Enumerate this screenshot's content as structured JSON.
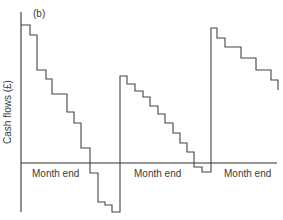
{
  "chart_data": {
    "type": "line",
    "subtype": "step",
    "title": "",
    "panel_label": "(b)",
    "xlabel": "",
    "ylabel": "Cash flows (£)",
    "x_tick_labels": [
      "Month end",
      "Month end",
      "Month end"
    ],
    "grid": false,
    "legend": null,
    "note": "Sawtooth cash-flow pattern: balance falls in steps through each month and jumps up at each month end. Values in relative units (0 = horizontal axis).",
    "series": [
      {
        "name": "Cash balance",
        "points_px": [
          [
            21,
            25
          ],
          [
            30,
            25
          ],
          [
            30,
            35
          ],
          [
            37,
            35
          ],
          [
            37,
            70
          ],
          [
            46,
            70
          ],
          [
            46,
            79
          ],
          [
            52,
            79
          ],
          [
            52,
            94
          ],
          [
            67,
            94
          ],
          [
            67,
            112
          ],
          [
            74,
            112
          ],
          [
            74,
            123
          ],
          [
            81,
            123
          ],
          [
            81,
            148
          ],
          [
            90,
            148
          ],
          [
            90,
            173
          ],
          [
            98,
            173
          ],
          [
            98,
            202
          ],
          [
            105,
            202
          ],
          [
            105,
            205
          ],
          [
            112,
            205
          ],
          [
            112,
            212
          ],
          [
            120,
            212
          ],
          [
            120,
            76
          ],
          [
            127,
            76
          ],
          [
            127,
            84
          ],
          [
            135,
            84
          ],
          [
            135,
            91
          ],
          [
            143,
            91
          ],
          [
            143,
            97
          ],
          [
            150,
            97
          ],
          [
            150,
            106
          ],
          [
            158,
            106
          ],
          [
            158,
            114
          ],
          [
            165,
            114
          ],
          [
            165,
            123
          ],
          [
            173,
            123
          ],
          [
            173,
            133
          ],
          [
            180,
            133
          ],
          [
            180,
            143
          ],
          [
            187,
            143
          ],
          [
            187,
            152
          ],
          [
            194,
            152
          ],
          [
            194,
            167
          ],
          [
            202,
            167
          ],
          [
            202,
            172
          ],
          [
            211,
            172
          ],
          [
            211,
            28
          ],
          [
            217,
            28
          ],
          [
            217,
            38
          ],
          [
            225,
            38
          ],
          [
            225,
            47
          ],
          [
            241,
            47
          ],
          [
            241,
            58
          ],
          [
            256,
            58
          ],
          [
            256,
            70
          ],
          [
            271,
            70
          ],
          [
            271,
            80
          ],
          [
            278,
            80
          ],
          [
            278,
            90
          ]
        ]
      }
    ],
    "relative_levels": {
      "month1": [
        138,
        128,
        93,
        84,
        69,
        51,
        40,
        15,
        -10,
        -39,
        -42,
        -49
      ],
      "month2": [
        87,
        79,
        72,
        66,
        57,
        49,
        40,
        30,
        20,
        11,
        -4,
        -9
      ],
      "month3": [
        135,
        125,
        116,
        105,
        93,
        83,
        73
      ]
    },
    "axes": {
      "y_axis_x_px": 21,
      "y_axis_top_px": 12,
      "y_axis_bottom_px": 212,
      "x_axis_y_px": 163,
      "x_axis_right_px": 277
    }
  },
  "labels": {
    "panel": "(b)",
    "y_axis": "Cash flows (£)",
    "month_end_1": "Month end",
    "month_end_2": "Month end",
    "month_end_3": "Month end"
  }
}
